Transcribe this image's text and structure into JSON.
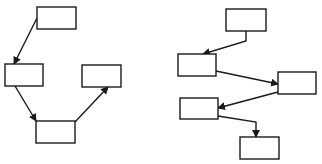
{
  "diagram": {
    "stroke_color": "#1a1a1a",
    "box_fill": "#ffffff",
    "background": "#ffffff",
    "left_flow": {
      "boxes": [
        {
          "id": "A",
          "x": 37,
          "y": 7,
          "w": 39,
          "h": 22
        },
        {
          "id": "B",
          "x": 5,
          "y": 64,
          "w": 38,
          "h": 22
        },
        {
          "id": "C",
          "x": 82,
          "y": 65,
          "w": 39,
          "h": 22
        },
        {
          "id": "D",
          "x": 36,
          "y": 121,
          "w": 39,
          "h": 22
        }
      ],
      "arrows": [
        {
          "from": "A",
          "to": "B",
          "points": [
            [
              37,
              18
            ],
            [
              14,
              64
            ]
          ]
        },
        {
          "from": "B",
          "to": "D",
          "points": [
            [
              15,
              86
            ],
            [
              36,
              121
            ]
          ]
        },
        {
          "from": "D",
          "to": "C",
          "points": [
            [
              75,
              122
            ],
            [
              108,
              87
            ]
          ]
        }
      ]
    },
    "right_flow": {
      "boxes": [
        {
          "id": "E",
          "x": 226,
          "y": 9,
          "w": 40,
          "h": 22
        },
        {
          "id": "F",
          "x": 178,
          "y": 54,
          "w": 38,
          "h": 22
        },
        {
          "id": "G",
          "x": 278,
          "y": 72,
          "w": 38,
          "h": 22
        },
        {
          "id": "H",
          "x": 180,
          "y": 98,
          "w": 38,
          "h": 21
        },
        {
          "id": "I",
          "x": 240,
          "y": 137,
          "w": 39,
          "h": 22
        }
      ],
      "arrows": [
        {
          "from": "E",
          "to": "F",
          "points": [
            [
              246,
              31
            ],
            [
              246,
              41
            ],
            [
              203,
              54
            ]
          ]
        },
        {
          "from": "F",
          "to": "G",
          "points": [
            [
              216,
              71
            ],
            [
              278,
              84
            ]
          ]
        },
        {
          "from": "G",
          "to": "H",
          "points": [
            [
              278,
              92
            ],
            [
              218,
              108
            ]
          ]
        },
        {
          "from": "H",
          "to": "I",
          "points": [
            [
              218,
              116
            ],
            [
              256,
              122
            ],
            [
              256,
              137
            ]
          ]
        }
      ]
    }
  }
}
